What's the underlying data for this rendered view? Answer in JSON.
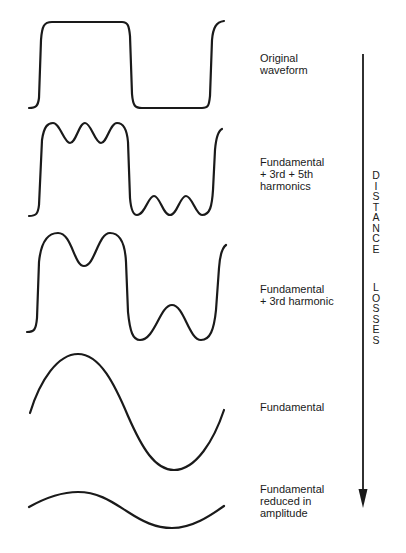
{
  "diagram": {
    "waveforms": [
      {
        "id": "original",
        "label_lines": [
          "Original",
          "waveform"
        ]
      },
      {
        "id": "fund-3rd-5th",
        "label_lines": [
          "Fundamental",
          "+ 3rd + 5th",
          "harmonics"
        ]
      },
      {
        "id": "fund-3rd",
        "label_lines": [
          "Fundamental",
          "+ 3rd harmonic"
        ]
      },
      {
        "id": "fundamental",
        "label_lines": [
          "Fundamental"
        ]
      },
      {
        "id": "fundamental-reduced",
        "label_lines": [
          "Fundamental",
          "reduced in",
          "amplitude"
        ]
      }
    ],
    "arrow": {
      "direction": "down",
      "label_word_1": [
        "D",
        "I",
        "S",
        "T",
        "A",
        "N",
        "C",
        "E"
      ],
      "label_word_2": [
        "L",
        "O",
        "S",
        "S",
        "E",
        "S"
      ],
      "label_full": "DISTANCE LOSSES"
    },
    "colors": {
      "stroke": "#1a1a1a",
      "background": "#ffffff"
    }
  }
}
